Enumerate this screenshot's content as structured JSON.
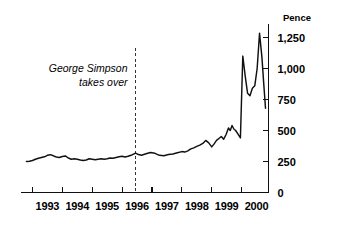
{
  "chart_data": {
    "type": "line",
    "title": "",
    "subtitle": "",
    "xlabel": "",
    "ylabel": "Pence",
    "unit_label": "Pence",
    "grid": false,
    "legend": "none",
    "xlim": [
      1992.6,
      2000.9
    ],
    "ylim": [
      0,
      1400
    ],
    "y_ticks": [
      0,
      250,
      500,
      750,
      1000,
      1250
    ],
    "y_tick_labels": [
      "0",
      "250",
      "500",
      "750",
      "1,000",
      "1,250"
    ],
    "y_axis_position": "right",
    "x_ticks": [
      1993,
      1994,
      1995,
      1996,
      1997,
      1998,
      1999,
      2000,
      2001
    ],
    "x_tick_labels": [
      "1993",
      "1994",
      "1995",
      "1996",
      "1997",
      "1998",
      "1999",
      "2000"
    ],
    "x_tick_label_positions": [
      1993.5,
      1994.5,
      1995.5,
      1996.5,
      1997.5,
      1998.5,
      1999.5,
      2000.5
    ],
    "annotations": [
      {
        "text_line_1": "George Simpson",
        "text_line_2": "takes over",
        "style": "italic",
        "marker": "dashed-vertical-line",
        "x": 1996.45
      }
    ],
    "series": [
      {
        "name": "Share price",
        "unit": "Pence",
        "x": [
          1992.8,
          1992.9,
          1993.0,
          1993.1,
          1993.2,
          1993.3,
          1993.4,
          1993.5,
          1993.6,
          1993.7,
          1993.8,
          1993.9,
          1994.0,
          1994.1,
          1994.2,
          1994.3,
          1994.4,
          1994.5,
          1994.6,
          1994.7,
          1994.8,
          1994.9,
          1995.0,
          1995.1,
          1995.2,
          1995.3,
          1995.4,
          1995.5,
          1995.6,
          1995.7,
          1995.8,
          1995.9,
          1996.0,
          1996.1,
          1996.2,
          1996.3,
          1996.45,
          1996.55,
          1996.65,
          1996.8,
          1996.95,
          1997.1,
          1997.25,
          1997.4,
          1997.55,
          1997.7,
          1997.85,
          1998.0,
          1998.1,
          1998.2,
          1998.3,
          1998.4,
          1998.5,
          1998.6,
          1998.7,
          1998.8,
          1998.9,
          1999.0,
          1999.08,
          1999.16,
          1999.24,
          1999.32,
          1999.4,
          1999.48,
          1999.56,
          1999.62,
          1999.68,
          1999.74,
          1999.8,
          1999.88,
          1999.96,
          2000.04,
          2000.12,
          2000.2,
          2000.28,
          2000.36,
          2000.44,
          2000.52,
          2000.6,
          2000.68,
          2000.74,
          2000.8
        ],
        "y": [
          250,
          252,
          258,
          268,
          276,
          282,
          288,
          300,
          305,
          296,
          286,
          282,
          290,
          295,
          278,
          268,
          272,
          268,
          262,
          258,
          262,
          272,
          268,
          264,
          268,
          272,
          268,
          272,
          278,
          276,
          282,
          288,
          292,
          286,
          292,
          300,
          318,
          306,
          300,
          312,
          322,
          316,
          300,
          296,
          306,
          310,
          320,
          330,
          326,
          336,
          352,
          360,
          372,
          382,
          396,
          420,
          400,
          368,
          392,
          420,
          436,
          452,
          430,
          468,
          520,
          500,
          540,
          512,
          500,
          470,
          440,
          1100,
          940,
          800,
          780,
          840,
          860,
          1000,
          1285,
          1090,
          880,
          680
        ]
      }
    ]
  },
  "axis": {
    "unit_label": "Pence",
    "y_labels": [
      "1,250",
      "1,000",
      "750",
      "500",
      "250",
      "0"
    ],
    "x_labels": [
      "1993",
      "1994",
      "1995",
      "1996",
      "1997",
      "1998",
      "1999",
      "2000"
    ]
  },
  "annotation": {
    "line1": "George Simpson",
    "line2": "takes over"
  },
  "colors": {
    "line": "#111111",
    "axis": "#111111",
    "event_marker": "#333333",
    "background": "#ffffff",
    "text": "#000000"
  }
}
